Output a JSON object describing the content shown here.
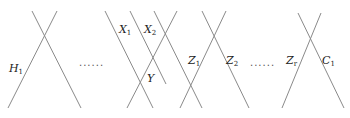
{
  "diagram": {
    "line_color": "#8a8a8a",
    "lines": [
      {
        "id": "h1-left",
        "x1": 8,
        "y1": 108,
        "x2": 57,
        "y2": 11
      },
      {
        "id": "h1-right",
        "x1": 32,
        "y1": 11,
        "x2": 81,
        "y2": 108
      },
      {
        "id": "x1-line",
        "x1": 105,
        "y1": 11,
        "x2": 153,
        "y2": 108
      },
      {
        "id": "x2-line",
        "x1": 130,
        "y1": 11,
        "x2": 166,
        "y2": 84
      },
      {
        "id": "y-line",
        "x1": 127,
        "y1": 108,
        "x2": 177,
        "y2": 11
      },
      {
        "id": "mid-line",
        "x1": 154,
        "y1": 11,
        "x2": 202,
        "y2": 108
      },
      {
        "id": "z1-line",
        "x1": 180,
        "y1": 108,
        "x2": 226,
        "y2": 11
      },
      {
        "id": "z2-line",
        "x1": 202,
        "y1": 11,
        "x2": 249,
        "y2": 108
      },
      {
        "id": "zr-line",
        "x1": 282,
        "y1": 108,
        "x2": 321,
        "y2": 13
      },
      {
        "id": "c1-line",
        "x1": 298,
        "y1": 13,
        "x2": 344,
        "y2": 108
      }
    ],
    "labels": [
      {
        "id": "H1",
        "main": "H",
        "sub": "1",
        "x": 9,
        "y": 63
      },
      {
        "id": "X1",
        "main": "X",
        "sub": "1",
        "x": 119,
        "y": 24
      },
      {
        "id": "X2",
        "main": "X",
        "sub": "2",
        "x": 144,
        "y": 24
      },
      {
        "id": "Y",
        "main": "Y",
        "sub": "",
        "x": 147,
        "y": 73
      },
      {
        "id": "Z1",
        "main": "Z",
        "sub": "1",
        "x": 188,
        "y": 55
      },
      {
        "id": "Z2",
        "main": "Z",
        "sub": "2",
        "x": 226,
        "y": 55
      },
      {
        "id": "Zr",
        "main": "Z",
        "sub": "r",
        "x": 286,
        "y": 55
      },
      {
        "id": "C1",
        "main": "C",
        "sub": "1",
        "x": 322,
        "y": 55
      }
    ],
    "ellipses": [
      {
        "id": "dots-left",
        "text": "......",
        "x": 79,
        "y": 58
      },
      {
        "id": "dots-right",
        "text": "......",
        "x": 250,
        "y": 58
      }
    ]
  }
}
